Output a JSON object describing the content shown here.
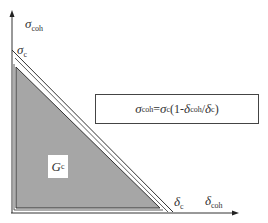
{
  "diagram": {
    "type": "cohesive-law-triangle",
    "axes": {
      "y_label": {
        "symbol": "σ",
        "subscript": "coh"
      },
      "x_label": {
        "symbol": "δ",
        "subscript": "coh"
      }
    },
    "y_intercept_label": {
      "symbol": "σ",
      "subscript": "c"
    },
    "x_intercept_label": {
      "symbol": "δ",
      "subscript": "c"
    },
    "area_label": {
      "symbol": "G",
      "subscript": "c"
    },
    "equation": {
      "lhs_symbol": "σ",
      "lhs_subscript": "coh",
      "eq": "=",
      "rhs_symbol": "σ",
      "rhs_subscript": "c",
      "open": "(1-",
      "num_symbol": "δ",
      "num_subscript": "coh",
      "slash": "/",
      "den_symbol": "δ",
      "den_subscript": "c",
      "close": ")"
    },
    "colors": {
      "fill": "#a6a6a6",
      "line": "#333333",
      "background": "#ffffff"
    }
  }
}
